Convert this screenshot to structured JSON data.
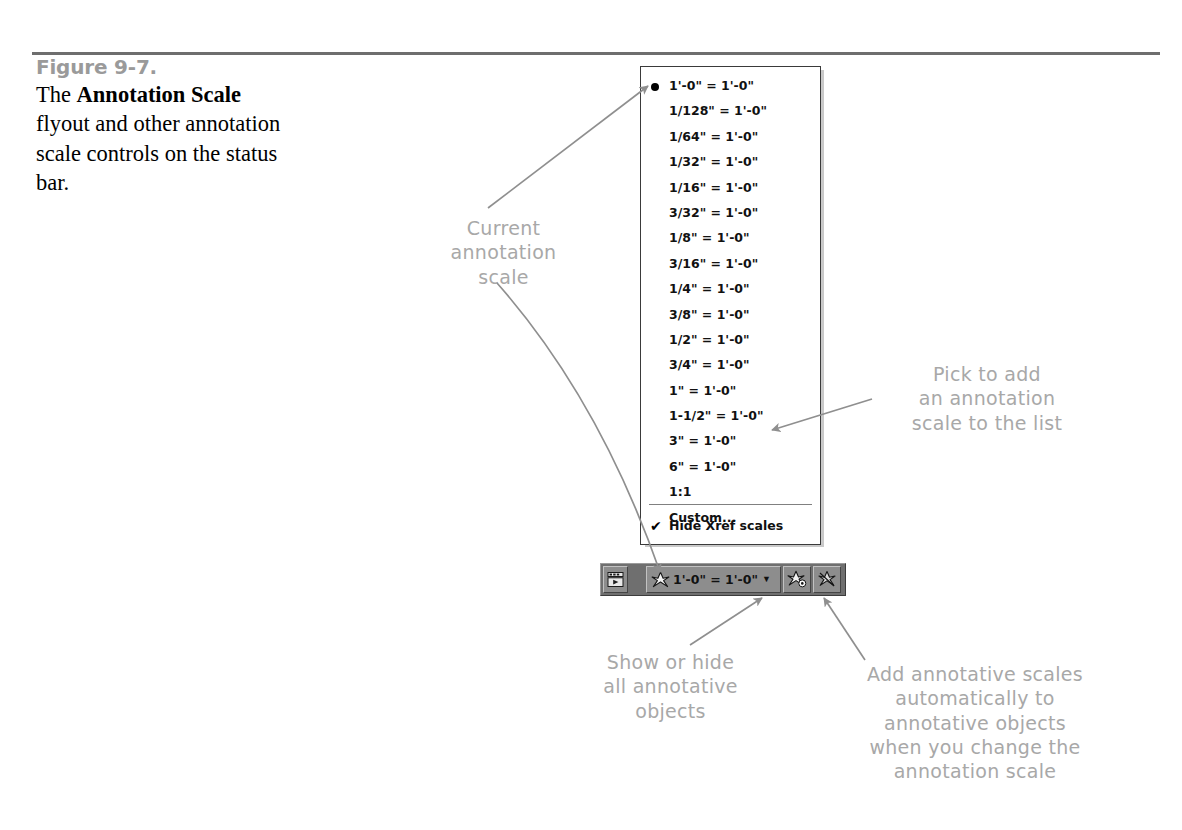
{
  "figure": {
    "number": "Figure 9-7.",
    "caption_plain": "The Annotation Scale flyout and other annotation scale controls on the status bar.",
    "caption_pre": "The ",
    "caption_bold1": "Annotation",
    "caption_mid": " ",
    "caption_bold2": "Scale",
    "caption_post": " flyout and other annotation scale controls on the status bar."
  },
  "flyout": {
    "name": "Annotation Scale flyout",
    "selected_scale": "1'-0\" = 1'-0\"",
    "items": [
      {
        "label": "1'-0\" = 1'-0\"",
        "checked": true
      },
      {
        "label": "1/128\" = 1'-0\"",
        "checked": false
      },
      {
        "label": "1/64\" = 1'-0\"",
        "checked": false
      },
      {
        "label": "1/32\" = 1'-0\"",
        "checked": false
      },
      {
        "label": "1/16\" = 1'-0\"",
        "checked": false
      },
      {
        "label": "3/32\" = 1'-0\"",
        "checked": false
      },
      {
        "label": "1/8\" = 1'-0\"",
        "checked": false
      },
      {
        "label": "3/16\" = 1'-0\"",
        "checked": false
      },
      {
        "label": "1/4\" = 1'-0\"",
        "checked": false
      },
      {
        "label": "3/8\" = 1'-0\"",
        "checked": false
      },
      {
        "label": "1/2\" = 1'-0\"",
        "checked": false
      },
      {
        "label": "3/4\" = 1'-0\"",
        "checked": false
      },
      {
        "label": "1\" = 1'-0\"",
        "checked": false
      },
      {
        "label": "1-1/2\" = 1'-0\"",
        "checked": false
      },
      {
        "label": "3\" = 1'-0\"",
        "checked": false
      },
      {
        "label": "6\" = 1'-0\"",
        "checked": false
      },
      {
        "label": "1:1",
        "checked": false
      },
      {
        "label": "Custom...",
        "checked": false
      }
    ],
    "xref_option": {
      "label": "Hide Xref scales",
      "checked": true,
      "check_glyph": "✔"
    }
  },
  "status_bar": {
    "window_icon": "clean-screen-icon",
    "scale_button": {
      "icon": "annotation-scale-icon",
      "label": "1'-0\" = 1'-0\"",
      "caret": "▼"
    },
    "annotation_visibility_button": {
      "icon": "annotative-visibility-icon"
    },
    "auto_scale_button": {
      "icon": "auto-add-scales-icon"
    }
  },
  "annotations": [
    {
      "id": "current",
      "text": "Current\nannotation\nscale"
    },
    {
      "id": "pick",
      "text": "Pick to add\nan annotation\nscale to the list"
    },
    {
      "id": "show",
      "text": "Show or hide\nall annotative\nobjects"
    },
    {
      "id": "add",
      "text": "Add annotative scales\nautomatically to\nannotative objects\nwhen you change the\nannotation scale"
    }
  ],
  "colors": {
    "annotation_gray": "#a8a8a8",
    "rule_gray": "#6e6e6e",
    "figure_number_gray": "#9a9a9a",
    "status_bar_bg": "#6f6f6f",
    "status_cell_bg": "#8d8d8d"
  }
}
